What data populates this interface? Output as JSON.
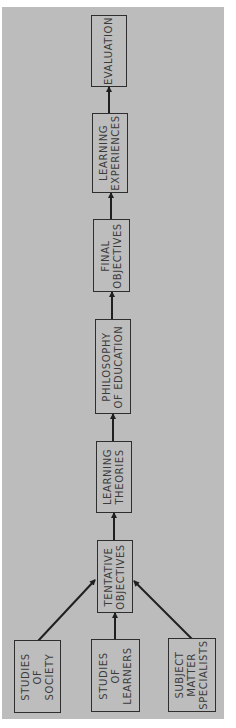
{
  "diagram": {
    "colors": {
      "background": "#bcbcbc",
      "box_fill": "#bdbdbd",
      "stroke": "#2e2e2e",
      "text": "#3b3b3b"
    },
    "nodes": [
      {
        "id": "evaluation",
        "label": "EVALUATION"
      },
      {
        "id": "learning-experiences",
        "label": "LEARNING\nEXPERIENCES"
      },
      {
        "id": "final-objectives",
        "label": "FINAL\nOBJECTIVES"
      },
      {
        "id": "philosophy-of-education",
        "label": "PHILOSOPHY\nOF EDUCATION"
      },
      {
        "id": "learning-theories",
        "label": "LEARNING\nTHEORIES"
      },
      {
        "id": "tentative-objectives",
        "label": "TENTATIVE\nOBJECTIVES"
      },
      {
        "id": "studies-of-society",
        "label": "STUDIES\nOF\nSOCIETY"
      },
      {
        "id": "studies-of-learners",
        "label": "STUDIES\nOF\nLEARNERS"
      },
      {
        "id": "subject-matter-specialists",
        "label": "SUBJECT\nMATTER\nSPECIALISTS"
      }
    ],
    "edges": [
      {
        "from": "studies-of-society",
        "to": "tentative-objectives"
      },
      {
        "from": "studies-of-learners",
        "to": "tentative-objectives"
      },
      {
        "from": "subject-matter-specialists",
        "to": "tentative-objectives"
      },
      {
        "from": "tentative-objectives",
        "to": "learning-theories"
      },
      {
        "from": "learning-theories",
        "to": "philosophy-of-education"
      },
      {
        "from": "philosophy-of-education",
        "to": "final-objectives"
      },
      {
        "from": "final-objectives",
        "to": "learning-experiences"
      },
      {
        "from": "learning-experiences",
        "to": "evaluation"
      }
    ]
  }
}
